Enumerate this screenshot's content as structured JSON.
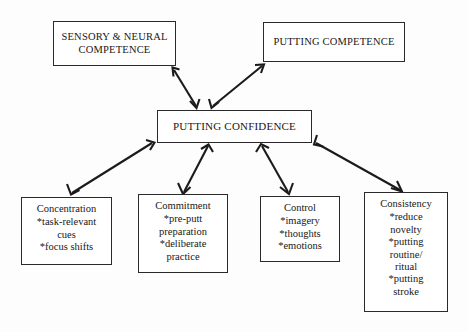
{
  "diagram": {
    "type": "flowchart",
    "background_color": "#fdfdfd",
    "line_color": "#1b1b1b",
    "box_border_color": "#2a2a2a",
    "top_boxes": [
      {
        "id": "sensory-neural-competence",
        "line1": "SENSORY & NEURAL",
        "line2": "COMPETENCE"
      },
      {
        "id": "putting-competence",
        "line1": "PUTTING COMPETENCE",
        "line2": ""
      }
    ],
    "center_box": {
      "id": "putting-confidence",
      "label": "PUTTING CONFIDENCE"
    },
    "bottom_boxes": [
      {
        "id": "concentration",
        "title": "Concentration",
        "items": [
          {
            "bullet": "*",
            "text": "task-relevant",
            "cont": "cues"
          },
          {
            "bullet": "*",
            "text": "focus shifts",
            "cont": ""
          }
        ]
      },
      {
        "id": "commitment",
        "title": "Commitment",
        "items": [
          {
            "bullet": "*",
            "text": "pre-putt",
            "cont": "preparation"
          },
          {
            "bullet": "*",
            "text": "deliberate",
            "cont": "practice"
          }
        ]
      },
      {
        "id": "control",
        "title": "Control",
        "items": [
          {
            "bullet": "*",
            "text": "imagery",
            "cont": ""
          },
          {
            "bullet": "*",
            "text": "thoughts",
            "cont": ""
          },
          {
            "bullet": "*",
            "text": "emotions",
            "cont": ""
          }
        ]
      },
      {
        "id": "consistency",
        "title": "Consistency",
        "items": [
          {
            "bullet": "*",
            "text": "reduce",
            "cont": "novelty"
          },
          {
            "bullet": "*",
            "text": "putting",
            "cont": "routine/"
          },
          {
            "bullet": "",
            "text": "",
            "cont": "ritual"
          },
          {
            "bullet": "*",
            "text": "putting",
            "cont": "stroke"
          }
        ]
      }
    ],
    "connectors": [
      {
        "from": "putting-confidence",
        "to": "sensory-neural-competence",
        "style": "double-headed"
      },
      {
        "from": "putting-confidence",
        "to": "putting-competence",
        "style": "double-headed"
      },
      {
        "from": "putting-confidence",
        "to": "concentration",
        "style": "double-headed"
      },
      {
        "from": "putting-confidence",
        "to": "commitment",
        "style": "double-headed"
      },
      {
        "from": "putting-confidence",
        "to": "control",
        "style": "double-headed"
      },
      {
        "from": "putting-confidence",
        "to": "consistency",
        "style": "double-headed"
      }
    ]
  }
}
